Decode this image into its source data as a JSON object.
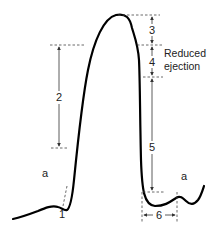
{
  "diagram": {
    "type": "arterial-pressure-waveform",
    "segment_labels": {
      "s1": "1",
      "s2": "2",
      "s3": "3",
      "s4": "4",
      "s5": "5",
      "s6": "6"
    },
    "wave_labels": {
      "a_left": "a",
      "a_right": "a"
    },
    "annotation": {
      "line1": "Reduced",
      "line2": "ejection"
    },
    "colors": {
      "curve": "#000000",
      "guides": "#444444",
      "text": "#222222"
    }
  }
}
